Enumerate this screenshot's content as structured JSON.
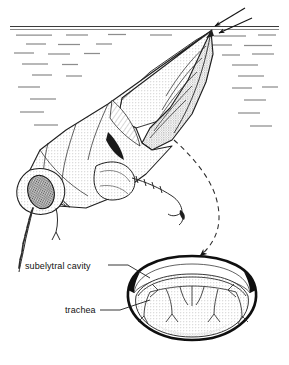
{
  "figure": {
    "width": 289,
    "height": 365,
    "style": "black-and-white stippled line drawing",
    "background_color": "#ffffff",
    "ink_color": "#111111"
  },
  "labels": {
    "subelytral_cavity": "subelytral cavity",
    "trachea": "trachea"
  },
  "annotations": {
    "air_intake_arrows": {
      "name": "air-intake-arrows",
      "count": 2,
      "direction": "down-left",
      "meaning": "air entering abdomen tip at the water surface"
    },
    "leader_line": {
      "name": "dashed-leader-arrow",
      "style": "dashed curve with arrowhead",
      "from": "beetle abdomen",
      "to": "cross-section diagram"
    },
    "label_leaders": {
      "subelytral_cavity": "line from label to thin air space beneath elytra",
      "trachea": "line from label to branching tubes in abdomen"
    }
  },
  "scene": {
    "water_surface": {
      "name": "water-surface-line",
      "y": 27,
      "line_count": 2
    },
    "water_texture": {
      "name": "water-dashes",
      "description": "short horizontal gray dashes indicating water below surface",
      "color": "#8d8d8d"
    },
    "beetle": {
      "name": "diving-beetle",
      "orientation": "head down, abdomen tip at surface",
      "parts": [
        "compound eye",
        "antenna",
        "head",
        "pronotum",
        "elytron",
        "hind wing",
        "legs",
        "abdomen"
      ]
    },
    "cross_section": {
      "name": "abdomen-cross-section",
      "parts": [
        "elytra (thick dark rim)",
        "subelytral cavity (thin light space)",
        "abdomen (stippled body)",
        "tracheae (branching tubes)"
      ]
    }
  },
  "colors": {
    "ink": "#111111",
    "water": "#8d8d8d",
    "stipple_light": "#e8e8e8",
    "stipple_mid": "#d2d2d2",
    "stipple_dark": "#9a9a9a"
  }
}
